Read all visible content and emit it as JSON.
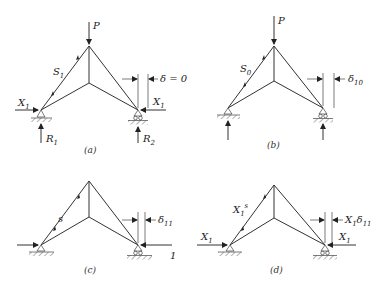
{
  "panels": [
    {
      "id": "a",
      "caption": "(a)",
      "load": "P",
      "member_force": "S",
      "member_force_sub": "1",
      "left_force": "X",
      "left_force_sub": "1",
      "right_force": "X",
      "right_force_sub": "1",
      "reaction_left": "R",
      "reaction_left_sub": "1",
      "reaction_right": "R",
      "reaction_right_sub": "2",
      "displacement": "δ = 0"
    },
    {
      "id": "b",
      "caption": "(b)",
      "load": "P",
      "member_force": "S",
      "member_force_sub": "0",
      "displacement": "δ",
      "displacement_sub": "10"
    },
    {
      "id": "c",
      "caption": "(c)",
      "member_force": "s",
      "right_unit_force": "1",
      "displacement": "δ",
      "displacement_sub": "11"
    },
    {
      "id": "d",
      "caption": "(d)",
      "member_force": "X",
      "member_force_sub": "1",
      "member_force_sup": "s",
      "left_force": "X",
      "left_force_sub": "1",
      "right_force": "X",
      "right_force_sub": "1",
      "displacement": "X",
      "displacement_sub": "1",
      "displacement_tail": "δ",
      "displacement_tail_sub": "11"
    }
  ]
}
